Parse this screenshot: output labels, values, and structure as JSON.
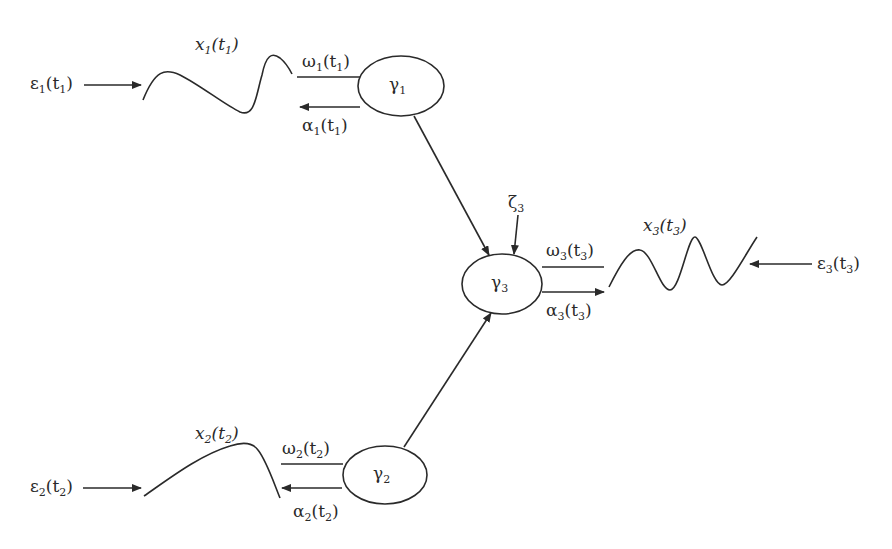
{
  "diagram": {
    "nodes": {
      "gamma1": {
        "symbol": "γ",
        "sub": "1"
      },
      "gamma2": {
        "symbol": "γ",
        "sub": "2"
      },
      "gamma3": {
        "symbol": "γ",
        "sub": "3"
      }
    },
    "labels": {
      "eps1": {
        "sym": "ε",
        "sub": "1",
        "arg": "t",
        "argsub": "1"
      },
      "x1": {
        "sym": "x",
        "sub": "1",
        "arg": "t",
        "argsub": "1"
      },
      "omega1": {
        "sym": "ω",
        "sub": "1",
        "arg": "t",
        "argsub": "1"
      },
      "alpha1": {
        "sym": "α",
        "sub": "1",
        "arg": "t",
        "argsub": "1"
      },
      "eps2": {
        "sym": "ε",
        "sub": "2",
        "arg": "t",
        "argsub": "2"
      },
      "x2": {
        "sym": "x",
        "sub": "2",
        "arg": "t",
        "argsub": "2"
      },
      "omega2": {
        "sym": "ω",
        "sub": "2",
        "arg": "t",
        "argsub": "2"
      },
      "alpha2": {
        "sym": "α",
        "sub": "2",
        "arg": "t",
        "argsub": "2"
      },
      "eps3": {
        "sym": "ε",
        "sub": "3",
        "arg": "t",
        "argsub": "3"
      },
      "x3": {
        "sym": "x",
        "sub": "3",
        "arg": "t",
        "argsub": "3"
      },
      "omega3": {
        "sym": "ω",
        "sub": "3",
        "arg": "t",
        "argsub": "3"
      },
      "alpha3": {
        "sym": "α",
        "sub": "3",
        "arg": "t",
        "argsub": "3"
      },
      "zeta3": {
        "sym": "ζ",
        "sub": "3"
      }
    },
    "stroke_color": "#2a2a2a"
  }
}
